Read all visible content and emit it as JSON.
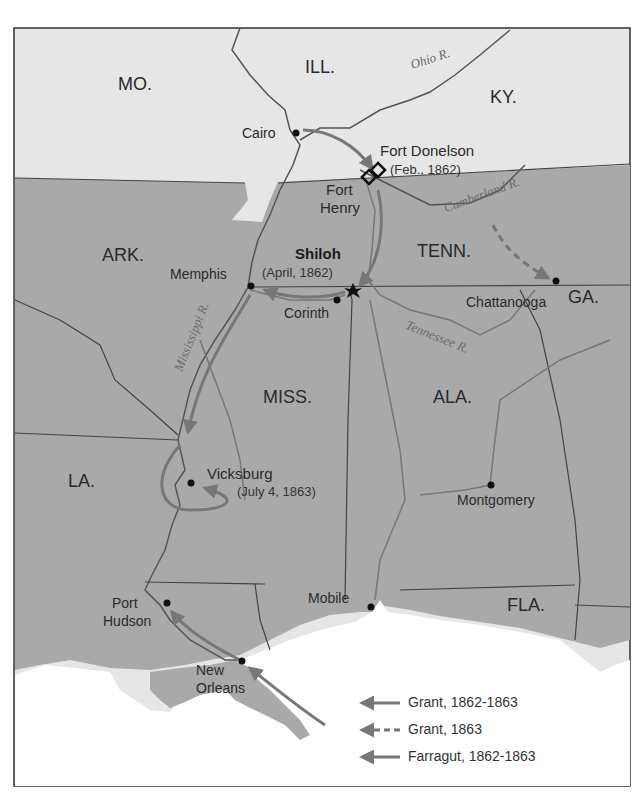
{
  "map": {
    "colors": {
      "union_land": "#e6e6e6",
      "confederate_land": "#a9a9a9",
      "water": "#ffffff",
      "border": "#444444",
      "river": "#6e6e6e",
      "route": "#777777",
      "frame": "#333333"
    },
    "states": {
      "mo": "MO.",
      "ill": "ILL.",
      "ky": "KY.",
      "ark": "ARK.",
      "tenn": "TENN.",
      "ga": "GA.",
      "miss": "MISS.",
      "ala": "ALA.",
      "la": "LA.",
      "fla": "FLA."
    },
    "rivers": {
      "ohio": "Ohio R.",
      "cumberland": "Cumberland R.",
      "tennessee": "Tennessee R.",
      "mississippi": "Mississippi R."
    },
    "cities": {
      "cairo": "Cairo",
      "fort_donelson": "Fort Donelson",
      "fort_donelson_date": "(Feb., 1862)",
      "fort_henry_1": "Fort",
      "fort_henry_2": "Henry",
      "shiloh": "Shiloh",
      "shiloh_date": "(April, 1862)",
      "memphis": "Memphis",
      "corinth": "Corinth",
      "chattanooga": "Chattanooga",
      "vicksburg": "Vicksburg",
      "vicksburg_date": "(July 4, 1863)",
      "montgomery": "Montgomery",
      "mobile": "Mobile",
      "port_hudson_1": "Port",
      "port_hudson_2": "Hudson",
      "new_orleans_1": "New",
      "new_orleans_2": "Orleans"
    },
    "legend": [
      {
        "label": "Grant, 1862-1863",
        "style": "solid"
      },
      {
        "label": "Grant, 1863",
        "style": "dashed"
      },
      {
        "label": "Farragut, 1862-1863",
        "style": "solid"
      }
    ]
  }
}
